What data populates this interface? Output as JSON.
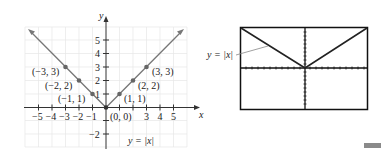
{
  "left_graph": {
    "axis_x_label": "x",
    "axis_y_label": "y",
    "x_tick_labels": [
      "−5",
      "−4",
      "−3",
      "−2",
      "−1",
      "3",
      "4",
      "5"
    ],
    "y_tick_labels": [
      "5",
      "4",
      "3",
      "2",
      "1",
      "−2"
    ],
    "equation_label": "y = |x|",
    "points": [
      {
        "label": "(−3, 3)",
        "x": -3,
        "y": 3
      },
      {
        "label": "(−2, 2)",
        "x": -2,
        "y": 2
      },
      {
        "label": "(−1, 1)",
        "x": -1,
        "y": 1
      },
      {
        "label": "(0, 0)",
        "x": 0,
        "y": 0
      },
      {
        "label": "(1, 1)",
        "x": 1,
        "y": 1
      },
      {
        "label": "(2, 2)",
        "x": 2,
        "y": 2
      },
      {
        "label": "(3, 3)",
        "x": 3,
        "y": 3
      }
    ],
    "curve_color": "#777777",
    "point_color": "#666666"
  },
  "right_graph": {
    "equation_label": "y = |x|",
    "screen_border_color": "#111111"
  }
}
